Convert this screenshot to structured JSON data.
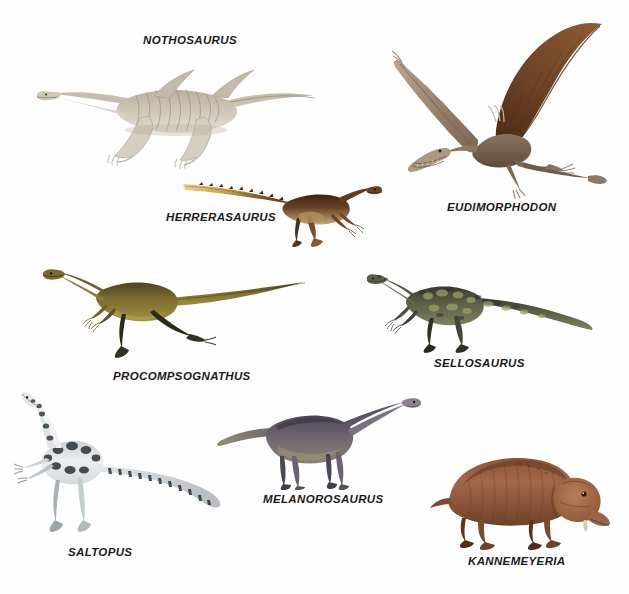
{
  "plate": {
    "background_color": "#ffffff",
    "label_color": "#1b1b1b",
    "width": 629,
    "height": 594
  },
  "specimens": [
    {
      "id": "nothosaurus",
      "label": "NOTHOSAURUS",
      "icon": "nothosaurus-illustration",
      "group": "sauropterygian marine reptile",
      "pose": "swimming, long neck and tail, four paddle limbs",
      "colors": {
        "body": "#cdc6b6",
        "shade": "#a9a08c",
        "dark": "#6f6857",
        "belly": "#e6e1d5"
      },
      "label_position": {
        "x": 143,
        "y": 35
      },
      "art_box": {
        "x": 36,
        "y": 56,
        "w": 282,
        "h": 108
      }
    },
    {
      "id": "eudimorphodon",
      "label": "EUDIMORPHODON",
      "icon": "eudimorphodon-illustration",
      "group": "pterosaur",
      "pose": "in flight, wings spread, long tail with vane",
      "colors": {
        "wing": "#6b4024",
        "wing_light": "#8a6b52",
        "body": "#7d6b58",
        "membrane": "#5a3620"
      },
      "label_position": {
        "x": 447,
        "y": 202
      },
      "art_box": {
        "x": 392,
        "y": 22,
        "w": 224,
        "h": 170
      }
    },
    {
      "id": "herrerasaurus",
      "label": "HERRERASAURUS",
      "icon": "herrerasaurus-illustration",
      "group": "early theropod-like dinosaur",
      "pose": "running, horizontal tail",
      "colors": {
        "body": "#6b4326",
        "back": "#3d2416",
        "tail_stripe": "#e8c86a",
        "belly": "#c9a878"
      },
      "label_position": {
        "x": 166,
        "y": 212
      },
      "art_box": {
        "x": 183,
        "y": 176,
        "w": 200,
        "h": 72
      }
    },
    {
      "id": "procompsognathus",
      "label": "PROCOMPSOGNATHUS",
      "icon": "procompsognathus-illustration",
      "group": "small coelophysoid dinosaur",
      "pose": "striding, long neck and tail",
      "colors": {
        "body": "#7b6a2f",
        "back": "#4a4420",
        "limb": "#2c2a1c",
        "belly": "#9d8c52"
      },
      "label_position": {
        "x": 113,
        "y": 371
      },
      "art_box": {
        "x": 42,
        "y": 262,
        "w": 268,
        "h": 100
      }
    },
    {
      "id": "sellosaurus",
      "label": "SELLOSAURUS",
      "icon": "sellosaurus-illustration",
      "group": "prosauropod dinosaur",
      "pose": "walking, mottled camouflage",
      "colors": {
        "body": "#5e6046",
        "mottle": "#9aa06a",
        "dark": "#30302a",
        "belly": "#6f7356"
      },
      "label_position": {
        "x": 434,
        "y": 358
      },
      "art_box": {
        "x": 366,
        "y": 268,
        "w": 240,
        "h": 86
      }
    },
    {
      "id": "saltopus",
      "label": "SALTOPUS",
      "icon": "saltopus-illustration",
      "group": "small bipedal dinosauriform",
      "pose": "standing upright, spotted pattern",
      "colors": {
        "body": "#e9ebec",
        "spots": "#2b3135",
        "shade": "#b9bfc2",
        "limb": "#c8ccce"
      },
      "label_position": {
        "x": 68,
        "y": 547
      },
      "art_box": {
        "x": 12,
        "y": 392,
        "w": 226,
        "h": 148
      }
    },
    {
      "id": "melanorosaurus",
      "label": "MELANOROSAURUS",
      "icon": "melanorosaurus-illustration",
      "group": "sauropodomorph dinosaur",
      "pose": "quadrupedal, long neck raised",
      "colors": {
        "body": "#6b6270",
        "back": "#4e4753",
        "flank": "#8a8470",
        "limb": "#574f5a"
      },
      "label_position": {
        "x": 263,
        "y": 494
      },
      "art_box": {
        "x": 216,
        "y": 398,
        "w": 212,
        "h": 92
      }
    },
    {
      "id": "kannemeyeria",
      "label": "KANNEMEYERIA",
      "icon": "kannemeyeria-illustration",
      "group": "dicynodont therapsid",
      "pose": "stocky quadruped, large head lowered",
      "colors": {
        "body": "#9b5f3f",
        "back": "#7d4a2e",
        "head": "#a8714c",
        "limb": "#6d4127"
      },
      "label_position": {
        "x": 468,
        "y": 556
      },
      "art_box": {
        "x": 428,
        "y": 440,
        "w": 184,
        "h": 110
      }
    }
  ]
}
